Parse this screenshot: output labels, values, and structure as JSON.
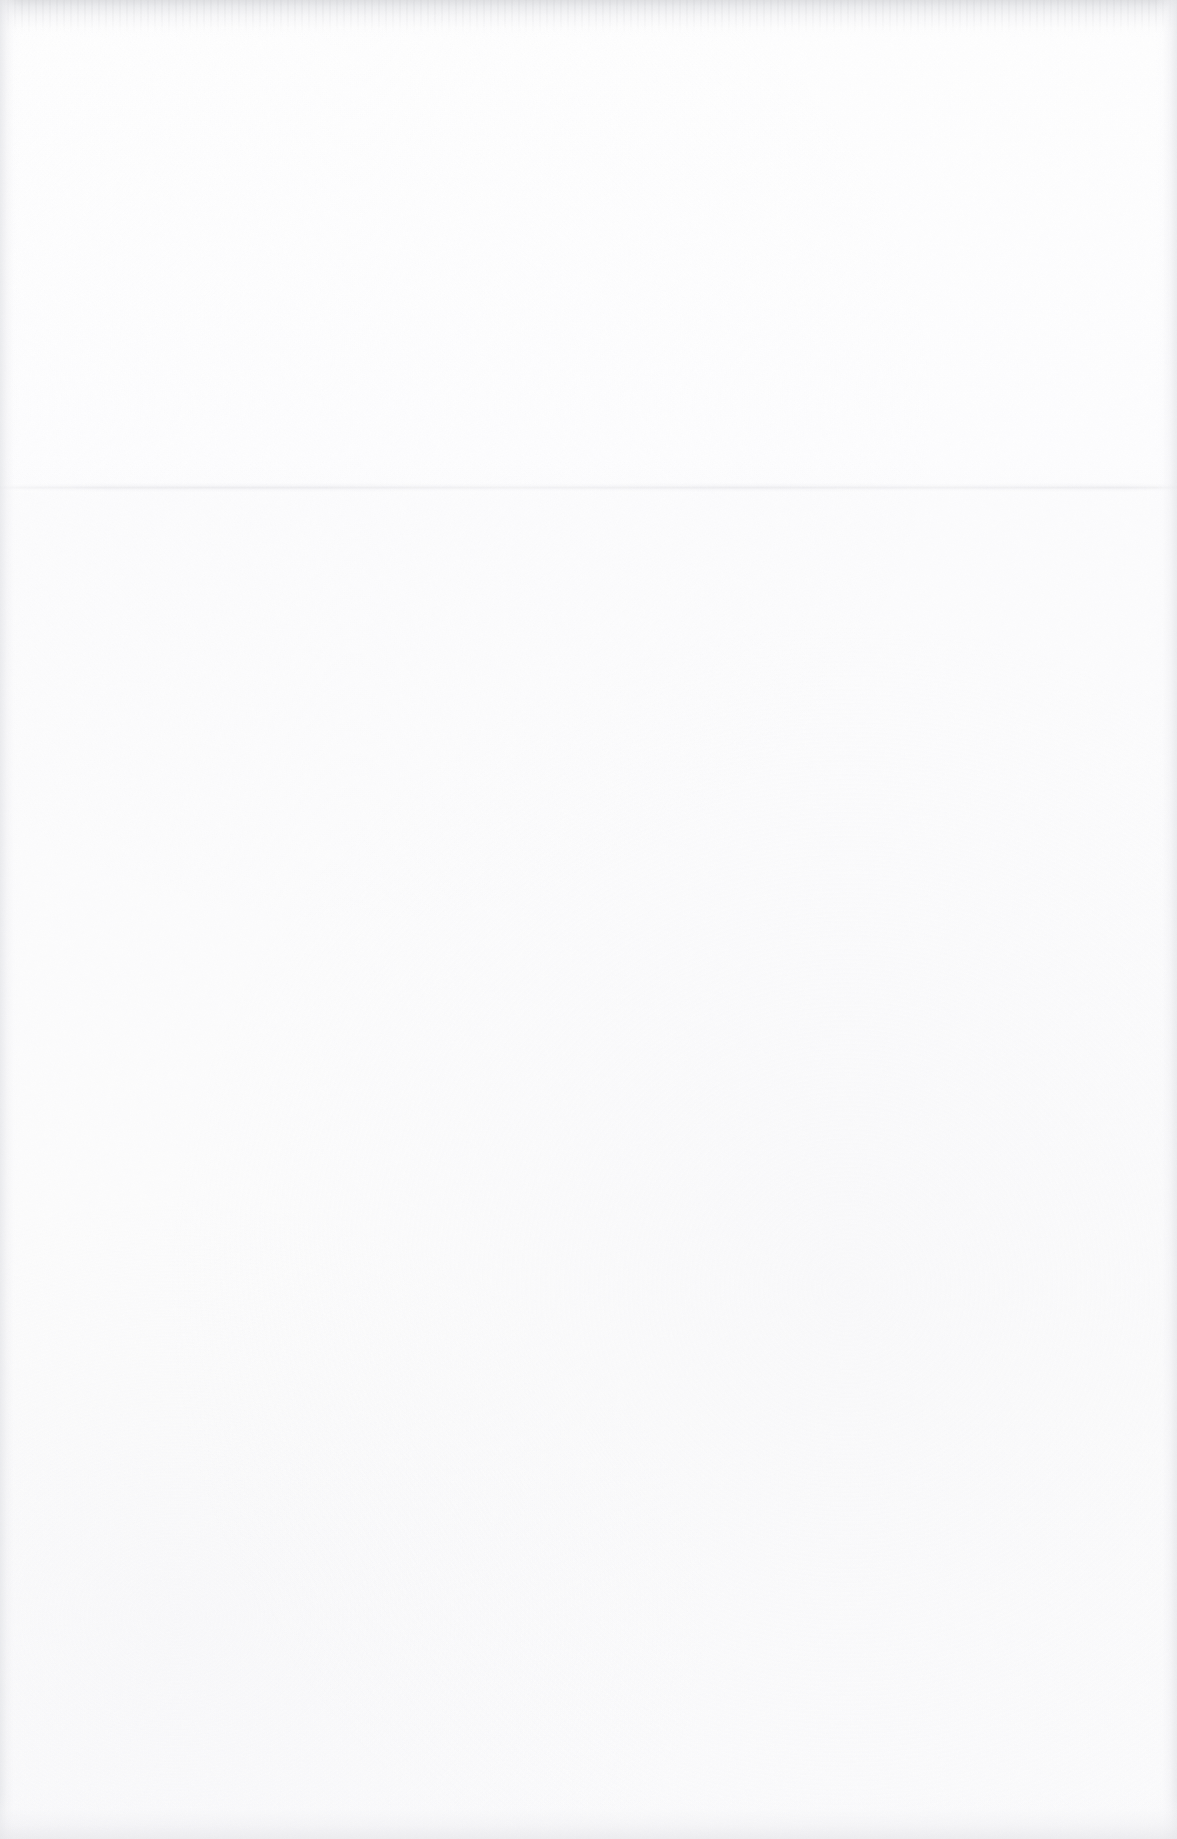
{
  "document": {
    "type": "scanned-page",
    "content_text": "",
    "page_description": "Blank scanned sheet of paper with no printed text, figures or ruling",
    "width_px": 1177,
    "height_px": 1839,
    "orientation": "portrait",
    "background_color": "#fdfdfd"
  },
  "artifacts": {
    "paper_tone_upper": "#fefefe",
    "paper_tone_lower": "#fbfbfc",
    "grain_color": "#f7f7f9",
    "edge_shadow_color": "#e6e7ea",
    "seam_color": "#eaeaed",
    "items": [
      {
        "name": "top-edge-shadow",
        "kind": "edge-shadow",
        "position": "top",
        "y_px": 0,
        "thickness_px": 38,
        "color": "#dadbde"
      },
      {
        "name": "scan-seam-line",
        "kind": "horizontal-line",
        "position": "mid-upper",
        "y_px": 487,
        "thickness_px": 3,
        "extent": "full-width",
        "color": "#eaeaed"
      },
      {
        "name": "left-edge-shadow",
        "kind": "edge-shadow",
        "position": "left",
        "x_px": 0,
        "thickness_px": 20,
        "color": "#e6e7ea"
      },
      {
        "name": "right-edge-shadow",
        "kind": "edge-shadow",
        "position": "right",
        "x_px": 1155,
        "thickness_px": 22,
        "color": "#e7e8eb"
      },
      {
        "name": "bottom-edge-shadow",
        "kind": "edge-shadow",
        "position": "bottom",
        "y_px": 1793,
        "thickness_px": 46,
        "color": "#e8e8eb"
      },
      {
        "name": "paper-grain",
        "kind": "texture",
        "position": "full-page",
        "description": "sparse neutral scanner speckle",
        "color": "#f7f7f9"
      }
    ]
  }
}
